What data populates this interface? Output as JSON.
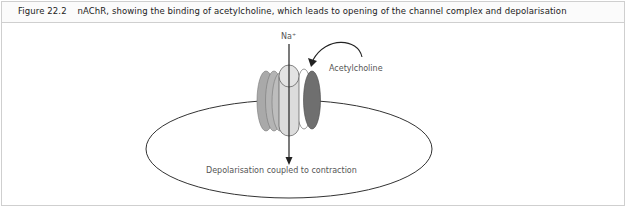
{
  "figure": {
    "number": "Figure 22.2",
    "caption": "nAChR, showing the binding of acetylcholine, which leads to opening of the channel complex and depolarisation"
  },
  "diagram": {
    "ion_label": "Na⁺",
    "ligand_label": "Acetylcholine",
    "cell_label": "Depolarisation coupled to contraction",
    "colors": {
      "subunit_light": "#d9d9d9",
      "subunit_mid": "#a8a8a8",
      "subunit_dark": "#6e6e6e",
      "outline": "#444444",
      "membrane": "#333333"
    }
  }
}
